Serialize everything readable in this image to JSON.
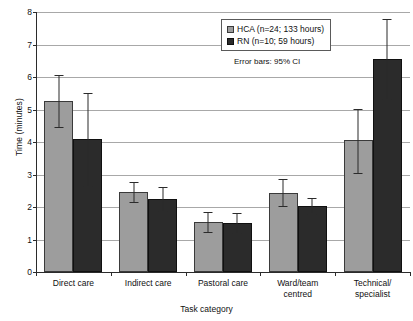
{
  "chart_data": {
    "type": "bar",
    "title": "",
    "xlabel": "Task category",
    "ylabel": "Time (minutes)",
    "ylim": [
      0,
      8
    ],
    "yticks": [
      0,
      1,
      2,
      3,
      4,
      5,
      6,
      7,
      8
    ],
    "grid": true,
    "legend_position": "top-right",
    "annotation": "Error bars: 95% CI",
    "categories": [
      "Direct care",
      "Indirect care",
      "Pastoral care",
      "Ward/team centred",
      "Technical/ specialist"
    ],
    "category_lines": [
      [
        "Direct care"
      ],
      [
        "Indirect care"
      ],
      [
        "Pastoral care"
      ],
      [
        "Ward/team",
        "centred"
      ],
      [
        "Technical/",
        "specialist"
      ]
    ],
    "series": [
      {
        "name": "HCA (n=24; 133 hours)",
        "short_name": "HCA",
        "color": "#9d9d9d",
        "values": [
          5.25,
          2.45,
          1.55,
          2.42,
          4.05
        ],
        "ci_low": [
          4.45,
          2.15,
          1.22,
          2.02,
          3.05
        ],
        "ci_high": [
          6.05,
          2.78,
          1.85,
          2.85,
          5.02
        ]
      },
      {
        "name": "RN (n=10; 59 hours)",
        "short_name": "RN",
        "color": "#2b2b2b",
        "values": [
          4.1,
          2.25,
          1.5,
          2.02,
          6.55
        ],
        "ci_low": [
          2.65,
          1.88,
          1.2,
          1.8,
          5.32
        ],
        "ci_high": [
          5.5,
          2.62,
          1.82,
          2.28,
          7.78
        ]
      }
    ]
  }
}
